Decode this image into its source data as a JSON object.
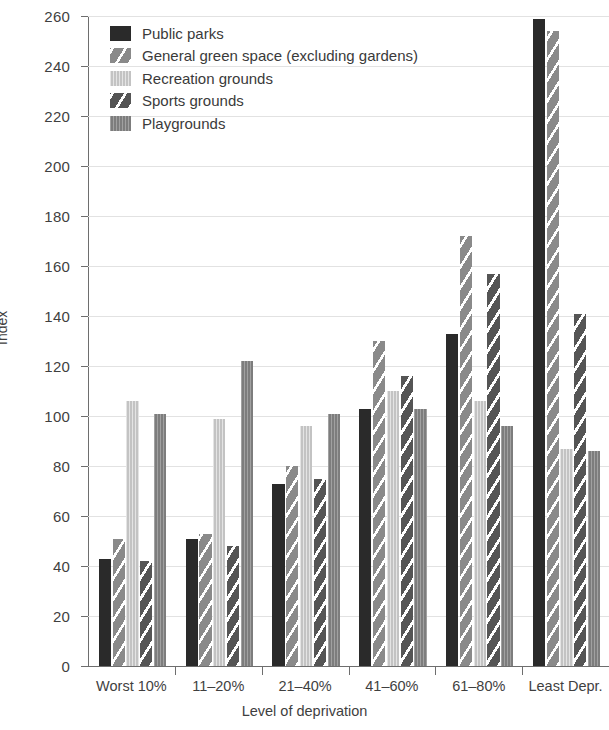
{
  "chart_data": {
    "type": "bar",
    "title": "",
    "xlabel": "Level of deprivation",
    "ylabel": "Index",
    "ylim": [
      0,
      260
    ],
    "ytick_step": 20,
    "yticks": [
      0,
      20,
      40,
      60,
      80,
      100,
      120,
      140,
      160,
      180,
      200,
      220,
      240,
      260
    ],
    "grid": true,
    "legend_position": "top-left inside plot",
    "categories": [
      "Worst 10%",
      "11–20%",
      "21–40%",
      "41–60%",
      "61–80%",
      "Least Depr."
    ],
    "series": [
      {
        "name": "Public parks",
        "values": [
          43,
          51,
          73,
          103,
          133,
          259
        ],
        "color": "#2a2a2a",
        "pattern": "solid"
      },
      {
        "name": "General green space (excluding gardens)",
        "values": [
          51,
          53,
          80,
          130,
          172,
          254
        ],
        "color": "#8a8a8a",
        "pattern": "diagonal-stripe"
      },
      {
        "name": "Recreation grounds",
        "values": [
          106,
          99,
          96,
          110,
          106,
          87
        ],
        "color": "#c3c3c3",
        "pattern": "vertical-line"
      },
      {
        "name": "Sports grounds",
        "values": [
          42,
          48,
          75,
          116,
          157,
          141
        ],
        "color": "#555555",
        "pattern": "diagonal-stripe-dark"
      },
      {
        "name": "Playgrounds",
        "values": [
          101,
          122,
          101,
          103,
          96,
          86
        ],
        "color": "#7d7d7d",
        "pattern": "solid-medium"
      }
    ]
  },
  "legend": {
    "items": [
      {
        "label": "Public parks",
        "swatch": "legend-swatch-public-parks"
      },
      {
        "label": "General green space (excluding gardens)",
        "swatch": "legend-swatch-general-green-space"
      },
      {
        "label": "Recreation grounds",
        "swatch": "legend-swatch-recreation-grounds"
      },
      {
        "label": "Sports grounds",
        "swatch": "legend-swatch-sports-grounds"
      },
      {
        "label": "Playgrounds",
        "swatch": "legend-swatch-playgrounds"
      }
    ]
  }
}
